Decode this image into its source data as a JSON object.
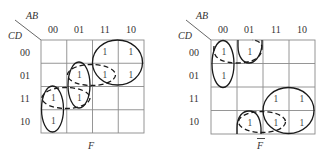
{
  "maps": [
    {
      "name": "F",
      "title": "F",
      "title_bar": false,
      "corner": {
        "col_var": "AB",
        "row_var": "CD"
      },
      "col_labels": [
        "00",
        "01",
        "11",
        "10"
      ],
      "row_labels": [
        "00",
        "01",
        "11",
        "10"
      ],
      "cells": [
        [
          "",
          "",
          "1",
          "1"
        ],
        [
          "",
          "1",
          "1",
          "1"
        ],
        [
          "1",
          "1",
          "",
          ""
        ],
        [
          "1",
          "",
          "",
          ""
        ]
      ],
      "groups": [
        {
          "style": "solid",
          "cells": "rows 00-01, cols 11-10"
        },
        {
          "style": "solid",
          "cells": "rows 01-11, col 01"
        },
        {
          "style": "solid",
          "cells": "rows 11-10, col 00"
        },
        {
          "style": "dashed",
          "cells": "row 01, cols 01-11"
        },
        {
          "style": "dashed",
          "cells": "row 11, cols 00-01"
        }
      ]
    },
    {
      "name": "F-bar",
      "title": "F",
      "title_bar": true,
      "corner": {
        "col_var": "AB",
        "row_var": "CD"
      },
      "col_labels": [
        "00",
        "01",
        "11",
        "10"
      ],
      "row_labels": [
        "00",
        "01",
        "11",
        "10"
      ],
      "cells": [
        [
          "1",
          "1",
          "",
          ""
        ],
        [
          "1",
          "",
          "",
          ""
        ],
        [
          "",
          "",
          "1",
          "1"
        ],
        [
          "",
          "1",
          "1",
          "1"
        ]
      ],
      "groups": [
        {
          "style": "solid",
          "cells": "rows 00-01, col 00"
        },
        {
          "style": "solid",
          "cells": "rows 10-00 (wrap), col 01"
        },
        {
          "style": "solid",
          "cells": "rows 11-10, cols 11-10"
        },
        {
          "style": "dashed",
          "cells": "row 00, cols 00-01"
        },
        {
          "style": "dashed",
          "cells": "row 10, cols 01-11"
        }
      ]
    }
  ]
}
